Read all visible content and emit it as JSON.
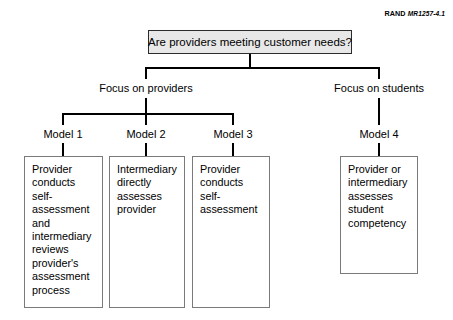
{
  "credit": {
    "brand": "RAND",
    "document_id": "MR1257-4.1"
  },
  "diagram": {
    "type": "tree",
    "root": {
      "label": "Are providers meeting customer needs?"
    },
    "branches": [
      {
        "label": "Focus on providers"
      },
      {
        "label": "Focus on students"
      }
    ],
    "models": [
      {
        "label": "Model 1"
      },
      {
        "label": "Model 2"
      },
      {
        "label": "Model 3"
      },
      {
        "label": "Model 4"
      }
    ],
    "descriptions": [
      {
        "text": "Provider conducts self-assessment and intermediary reviews provider's assessment process"
      },
      {
        "text": "Intermediary directly assesses provider"
      },
      {
        "text": "Provider conducts self-assessment"
      },
      {
        "text": "Provider or intermediary assesses student competency"
      }
    ]
  },
  "colors": {
    "root_fill": "#e8e8e8",
    "root_border": "#2b2b2b",
    "leaf_border": "#7a7a7a",
    "connector": "#000000",
    "text": "#000000",
    "background": "#ffffff"
  }
}
